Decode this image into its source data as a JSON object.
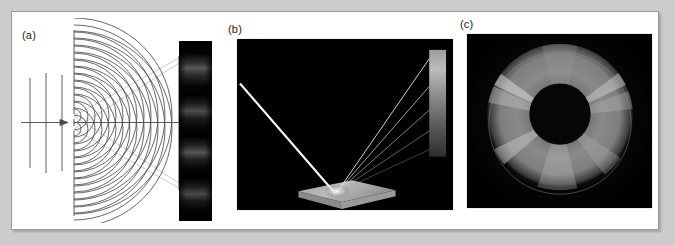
{
  "figure": {
    "background_color": "#cccccc",
    "card_color": "#ffffff",
    "card_border_color": "#9a9a9a",
    "panels": [
      {
        "label": "(a)",
        "name": "wave-interference-schematic",
        "kind": "line-diagram",
        "description": "Plane wavefronts incident from the left on a double aperture, producing two sets of expanding circular wavefronts that interfere; a vertical detection screen stands at the right and faint straight nodal lines fan out from the apertures.",
        "line_color": "#4a4a52",
        "nodal_line_color": "#b9b9c2",
        "elements": {
          "plane_wavefront_count": 3,
          "incident_arrow": "right-arrow",
          "aperture_count": 2,
          "circular_wavefront_count": 11,
          "nodal_line_count": 4,
          "screen": "vertical-line"
        }
      },
      {
        "label": "",
        "name": "interference-intensity-strip",
        "kind": "intensity-strip",
        "description": "Vertical black strip showing the recorded fringe intensity pattern: broad dark bands separated by dim grey maxima.",
        "background_color": "#000000",
        "fringe_color": "#6b6b6b",
        "fringe_count": 5
      },
      {
        "label": "(b)",
        "name": "grating-diffraction-photograph",
        "kind": "photograph",
        "description": "Dark-field photograph: a single bright laser beam arrives from the upper left onto a grey flat sample plate and fans out into several diffracted orders that strike a vertical grey detector card at the right.",
        "background_color": "#010101",
        "beam_color": "#f5f5f5",
        "plate_color": "#a8a8a8",
        "detector_color": "#8d8d8d",
        "diffracted_order_count": 5
      },
      {
        "label": "(c)",
        "name": "annular-diffraction-pattern",
        "kind": "photograph",
        "description": "Dark-field photograph of an annular diffraction pattern: a bright grey ring of material around an opaque dark central disc, crossed by broad radial bright streaks forming an X-shaped figure.",
        "background_color": "#050505",
        "ring_color": "#8f8f8f",
        "streak_color": "#d6d6d6",
        "core_color": "#050505",
        "streak_count": 6
      }
    ]
  }
}
